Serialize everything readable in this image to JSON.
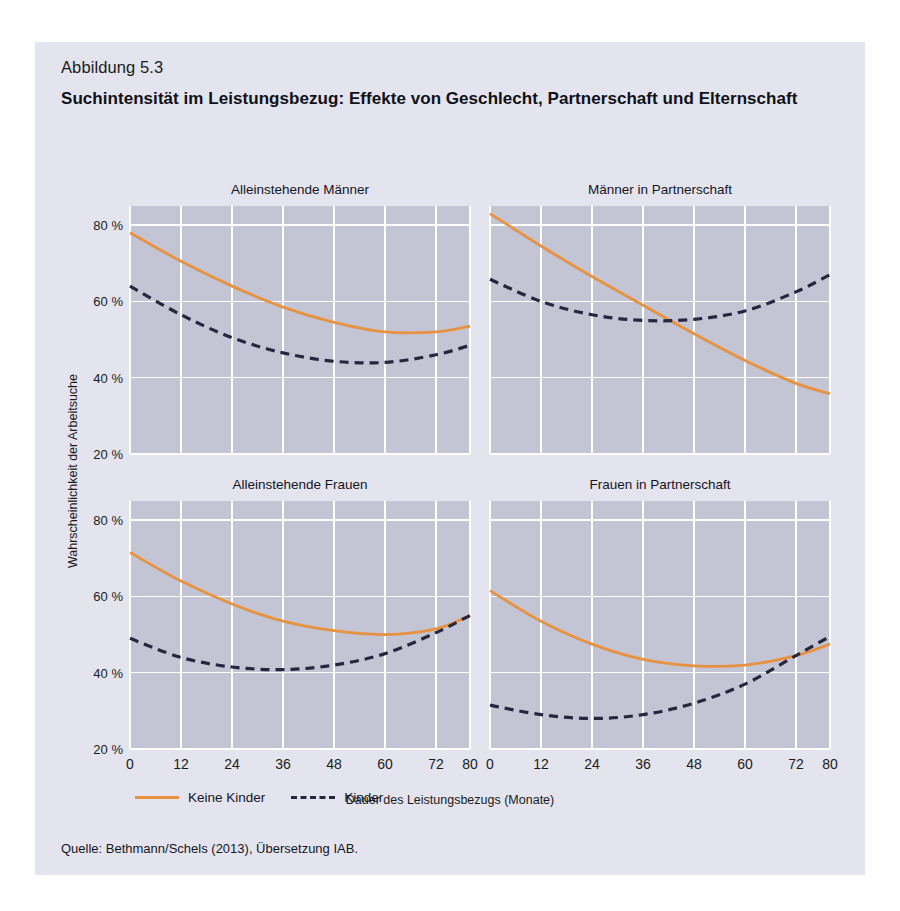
{
  "figure": {
    "number": "Abbildung 5.3",
    "title": "Suchintensität im Leistungsbezug: Effekte von Geschlecht, Partnerschaft und Elternschaft",
    "source": "Quelle: Bethmann/Schels (2013), Übersetzung IAB."
  },
  "colors": {
    "page_background": "#ffffff",
    "figure_background": "#e3e4ee",
    "plot_background": "#c3c5d4",
    "gridline": "#ffffff",
    "series_no_children": "#e8913f",
    "series_children": "#26263f",
    "text": "#15151c"
  },
  "legend": {
    "position": "below-axis-left",
    "items": [
      {
        "label": "Keine Kinder",
        "color": "#e8913f",
        "style": "solid"
      },
      {
        "label": "Kinder",
        "color": "#26263f",
        "style": "dashed"
      }
    ]
  },
  "chart_data": {
    "type": "line",
    "title": "Suchintensität im Leistungsbezug: Effekte von Geschlecht, Partnerschaft und Elternschaft",
    "xlabel": "Dauer des Leistungsbezugs (Monate)",
    "ylabel": "Wahrscheinlichkeit der Arbeitsuche",
    "xlim": [
      0,
      80
    ],
    "ylim": [
      20,
      85
    ],
    "xticks": [
      0,
      12,
      24,
      36,
      48,
      60,
      72,
      80
    ],
    "xtick_labels": [
      "0",
      "12",
      "24",
      "36",
      "48",
      "60",
      "72",
      "80"
    ],
    "yticks": [
      20,
      40,
      60,
      80
    ],
    "ytick_labels": [
      "20 %",
      "40 %",
      "60 %",
      "80 %"
    ],
    "grid": true,
    "units": "percent",
    "panels": [
      {
        "title": "Alleinstehende Männer",
        "x": [
          0,
          12,
          24,
          36,
          48,
          60,
          72,
          80
        ],
        "series": [
          {
            "name": "Keine Kinder",
            "style": "solid",
            "color": "#e8913f",
            "values": [
              78.0,
              70.5,
              64.0,
              58.5,
              54.5,
              52.0,
              52.0,
              53.5
            ]
          },
          {
            "name": "Kinder",
            "style": "dashed",
            "color": "#26263f",
            "values": [
              64.0,
              56.5,
              50.5,
              46.5,
              44.3,
              44.0,
              46.0,
              48.5
            ]
          }
        ]
      },
      {
        "title": "Männer in Partnerschaft",
        "x": [
          0,
          12,
          24,
          36,
          48,
          60,
          72,
          80
        ],
        "series": [
          {
            "name": "Keine Kinder",
            "style": "solid",
            "color": "#e8913f",
            "values": [
              83.0,
              74.5,
              66.5,
              59.0,
              51.5,
              44.5,
              38.5,
              35.8
            ]
          },
          {
            "name": "Kinder",
            "style": "dashed",
            "color": "#26263f",
            "values": [
              65.8,
              60.0,
              56.5,
              55.0,
              55.3,
              57.5,
              62.5,
              67.0
            ]
          }
        ]
      },
      {
        "title": "Alleinstehende Frauen",
        "x": [
          0,
          12,
          24,
          36,
          48,
          60,
          72,
          80
        ],
        "series": [
          {
            "name": "Keine Kinder",
            "style": "solid",
            "color": "#e8913f",
            "values": [
              71.5,
              64.0,
              58.0,
              53.5,
              51.0,
              50.0,
              51.5,
              55.0
            ]
          },
          {
            "name": "Kinder",
            "style": "dashed",
            "color": "#26263f",
            "values": [
              49.0,
              44.0,
              41.5,
              40.8,
              42.0,
              45.0,
              50.5,
              55.0
            ]
          }
        ]
      },
      {
        "title": "Frauen in Partnerschaft",
        "x": [
          0,
          12,
          24,
          36,
          48,
          60,
          72,
          80
        ],
        "series": [
          {
            "name": "Keine Kinder",
            "style": "solid",
            "color": "#e8913f",
            "values": [
              61.5,
              53.5,
              47.5,
              43.5,
              41.8,
              42.0,
              44.5,
              47.5
            ]
          },
          {
            "name": "Kinder",
            "style": "dashed",
            "color": "#26263f",
            "values": [
              31.5,
              29.0,
              28.0,
              29.0,
              32.0,
              37.0,
              44.5,
              49.5
            ]
          }
        ]
      }
    ]
  }
}
